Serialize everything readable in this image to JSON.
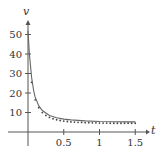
{
  "chart_data": {
    "type": "line",
    "title": "",
    "xlabel": "t",
    "ylabel": "v",
    "xlim": [
      0,
      1.5
    ],
    "ylim": [
      0,
      55
    ],
    "x_ticks": [
      "0.5",
      "1",
      "1.5"
    ],
    "y_ticks": [
      "10",
      "20",
      "30",
      "40",
      "50"
    ],
    "grid": false,
    "legend": null,
    "series": [
      {
        "name": "curve",
        "style": "solid-line",
        "x": [
          0.0,
          0.02,
          0.05,
          0.08,
          0.1,
          0.15,
          0.2,
          0.3,
          0.4,
          0.5,
          0.6,
          0.8,
          1.0,
          1.2,
          1.4,
          1.5
        ],
        "y": [
          52,
          40,
          28,
          21,
          18,
          13.5,
          11,
          8.5,
          7.3,
          6.6,
          6.2,
          5.7,
          5.4,
          5.3,
          5.2,
          5.2
        ]
      },
      {
        "name": "data points",
        "style": "dots",
        "x": [
          0.05,
          0.1,
          0.15,
          0.2,
          0.25,
          0.3,
          0.35,
          0.4,
          0.45,
          0.5,
          0.55,
          0.6,
          0.65,
          0.7,
          0.75,
          0.8,
          0.85,
          0.9,
          0.95,
          1.0,
          1.05,
          1.1,
          1.15,
          1.2,
          1.25,
          1.3,
          1.35,
          1.4,
          1.45,
          1.5
        ],
        "y": [
          26,
          17,
          13,
          10.5,
          9,
          8,
          7.3,
          6.8,
          6.4,
          6.1,
          5.9,
          5.7,
          5.6,
          5.5,
          5.4,
          5.3,
          5.3,
          5.2,
          5.2,
          5.1,
          5.1,
          5.1,
          5.0,
          5.0,
          5.0,
          5.0,
          5.0,
          5.0,
          5.0,
          5.0
        ]
      }
    ]
  },
  "colors": {
    "axis": "#555555",
    "curve": "#666666",
    "points": "#444444"
  }
}
